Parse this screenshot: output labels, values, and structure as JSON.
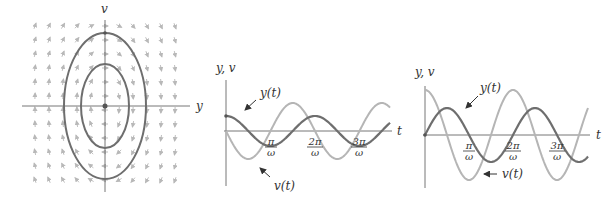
{
  "chart_data": [
    {
      "type": "line",
      "title": "Phase portrait",
      "xlabel": "y",
      "ylabel": "v",
      "grid": false,
      "description": "Direction field with closed elliptical trajectories around the origin (center)",
      "trajectories": [
        {
          "name": "outer ellipse",
          "rx": 41,
          "ry": 73
        },
        {
          "name": "inner ellipse",
          "rx": 24,
          "ry": 42
        }
      ],
      "colors": {
        "trajectory": "#6e6e6e",
        "field": "#b8b8b8",
        "axis": "#777777"
      }
    },
    {
      "type": "line",
      "title": "Solution with y(0) > 0, v(0) = 0",
      "xlabel": "t",
      "ylabel": "y, v",
      "x_ticks": [
        "π/ω",
        "2π/ω",
        "3π/ω"
      ],
      "series": [
        {
          "name": "y(t)",
          "form": "A cos(ωt)",
          "amplitude": 0.5,
          "color": "#6e6e6e"
        },
        {
          "name": "v(t)",
          "form": "-B sin(ωt)",
          "amplitude": 1.0,
          "color": "#b5b5b5"
        }
      ],
      "annotations": [
        "y(t)",
        "v(t)"
      ]
    },
    {
      "type": "line",
      "title": "Solution with y(0) = 0, v(0) > 0",
      "xlabel": "t",
      "ylabel": "y, v",
      "x_ticks": [
        "π/ω",
        "2π/ω",
        "3π/ω"
      ],
      "series": [
        {
          "name": "y(t)",
          "form": "A sin(ωt)",
          "amplitude": 0.6,
          "color": "#6e6e6e"
        },
        {
          "name": "v(t)",
          "form": "B cos(ωt)",
          "amplitude": 1.0,
          "color": "#b5b5b5"
        }
      ],
      "annotations": [
        "y(t)",
        "v(t)"
      ]
    }
  ],
  "labels": {
    "phase": {
      "x": "y",
      "y": "v"
    },
    "mid": {
      "axes": "y, v",
      "t": "t",
      "y_curve": "y(t)",
      "v_curve": "v(t)"
    },
    "right": {
      "axes": "y, v",
      "t": "t",
      "y_curve": "y(t)",
      "v_curve": "v(t)"
    },
    "ticks": {
      "pi": "π",
      "two_pi": "2π",
      "three_pi": "3π",
      "omega": "ω"
    }
  }
}
